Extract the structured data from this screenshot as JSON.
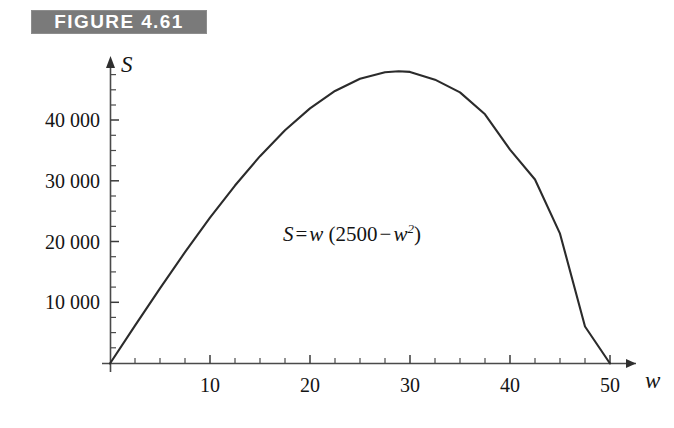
{
  "figure": {
    "banner_label": "FIGURE 4.61",
    "banner_color": "#7a7a7a",
    "banner_text_color": "#ffffff"
  },
  "equation": {
    "lhs": "S",
    "equals": "=",
    "factor": "w",
    "open_paren": "(",
    "constant": "2500",
    "minus": "−",
    "variable": "w",
    "exponent": "2",
    "close_paren": ")",
    "full_text": "S = w (2500 − w²)"
  },
  "axes": {
    "x_name": "w",
    "y_name": "S",
    "x_ticks": [
      {
        "value": 10,
        "label": "10"
      },
      {
        "value": 20,
        "label": "20"
      },
      {
        "value": 30,
        "label": "30"
      },
      {
        "value": 40,
        "label": "40"
      },
      {
        "value": 50,
        "label": "50"
      }
    ],
    "y_ticks": [
      {
        "value": 10000,
        "label": "10 000"
      },
      {
        "value": 20000,
        "label": "20 000"
      },
      {
        "value": 30000,
        "label": "30 000"
      },
      {
        "value": 40000,
        "label": "40 000"
      }
    ]
  },
  "chart_data": {
    "type": "line",
    "title": "FIGURE 4.61",
    "xlabel": "w",
    "ylabel": "S",
    "grid": false,
    "legend": null,
    "annotations": [
      {
        "text": "S = w (2500 − w²)",
        "x": 19,
        "y": 23500
      }
    ],
    "xlim": [
      0,
      52
    ],
    "ylim": [
      0,
      52000
    ],
    "xticks": [
      10,
      20,
      30,
      40,
      50
    ],
    "xtick_labels": [
      "10",
      "20",
      "30",
      "40",
      "50"
    ],
    "yticks": [
      10000,
      20000,
      30000,
      40000
    ],
    "ytick_labels": [
      "10 000",
      "20 000",
      "30 000",
      "40 000"
    ],
    "x_minor_tick_step": 2.5,
    "y_minor_tick_step": 2500,
    "curve_color": "#2b2b2b",
    "axis_color": "#4a4a4a",
    "equation": "S = w * (2500 - w^2)",
    "series": [
      {
        "name": "S = w (2500 - w^2)",
        "x": [
          0,
          2.5,
          5,
          7.5,
          10,
          12.5,
          15,
          17.5,
          20,
          22.5,
          25,
          27.5,
          28.8675,
          30,
          32.5,
          35,
          37.5,
          40,
          42.5,
          45,
          47.5,
          50
        ],
        "y": [
          0,
          6234,
          12375,
          18328,
          24000,
          29297,
          34125,
          38391,
          42000,
          44859,
          46875,
          47953,
          48112.5,
          48000,
          46719,
          44625,
          41016,
          35200,
          30281,
          21375,
          6094,
          0
        ]
      }
    ],
    "maximum": {
      "w": 28.87,
      "S": 48112.5
    },
    "roots": [
      0,
      50
    ]
  }
}
